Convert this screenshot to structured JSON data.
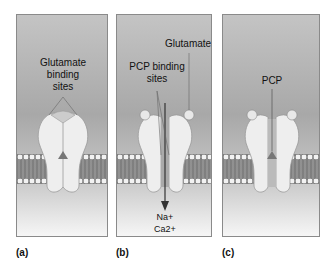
{
  "panels": [
    {
      "id": "a",
      "label": "(a)",
      "annotations": [
        "Glutamate",
        "binding",
        "sites"
      ]
    },
    {
      "id": "b",
      "label": "(b)",
      "annotations": {
        "glutamate": "Glutamate",
        "pcp_sites_1": "PCP binding",
        "pcp_sites_2": "sites",
        "ion_1": "Na+",
        "ion_2": "Ca2+"
      }
    },
    {
      "id": "c",
      "label": "(c)",
      "annotations": {
        "pcp": "PCP"
      }
    }
  ],
  "colors": {
    "background_top": "#a8a8a8",
    "background_bottom": "#f6f6f6",
    "receptor": "#eeeeee",
    "membrane": "#888888"
  }
}
